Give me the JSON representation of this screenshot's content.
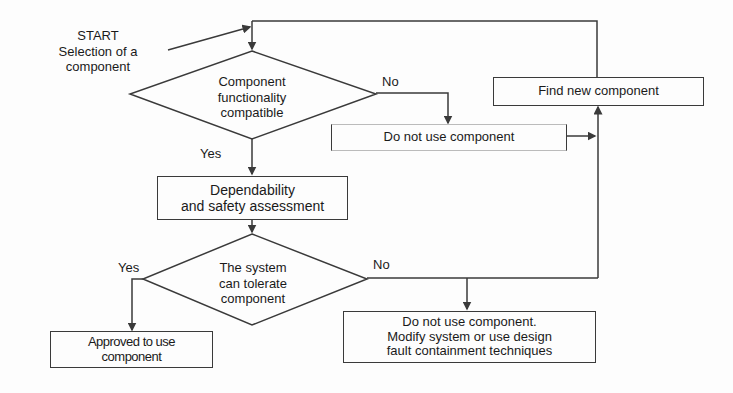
{
  "diagram": {
    "start": {
      "line1": "START",
      "line2": "Selection of a",
      "line3": "component"
    },
    "decision1": {
      "line1": "Component",
      "line2": "functionality",
      "line3": "compatible"
    },
    "decision1_yes": "Yes",
    "decision1_no": "No",
    "box_do_not_use": "Do not use component",
    "box_find_new": "Find new component",
    "box_assessment": {
      "line1": "Dependability",
      "line2": "and safety assessment"
    },
    "decision2": {
      "line1": "The system",
      "line2": "can tolerate",
      "line3": "component"
    },
    "decision2_yes": "Yes",
    "decision2_no": "No",
    "box_approved": {
      "line1": "Approved to use",
      "line2": "component"
    },
    "box_modify": {
      "line1": "Do not use component.",
      "line2": "Modify system or use design",
      "line3": "fault containment techniques"
    },
    "colors": {
      "line": "#3a3a3a",
      "background": "#fdfdfd",
      "text": "#1a1a1a"
    }
  }
}
